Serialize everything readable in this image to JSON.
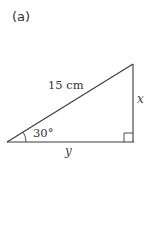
{
  "figure": {
    "part_label": "(a)",
    "hypotenuse_label": "15 cm",
    "opposite_label": "x",
    "adjacent_label": "y",
    "angle_label": "30°",
    "right_angle_marker": true,
    "line_color": "#3a3a3a"
  }
}
